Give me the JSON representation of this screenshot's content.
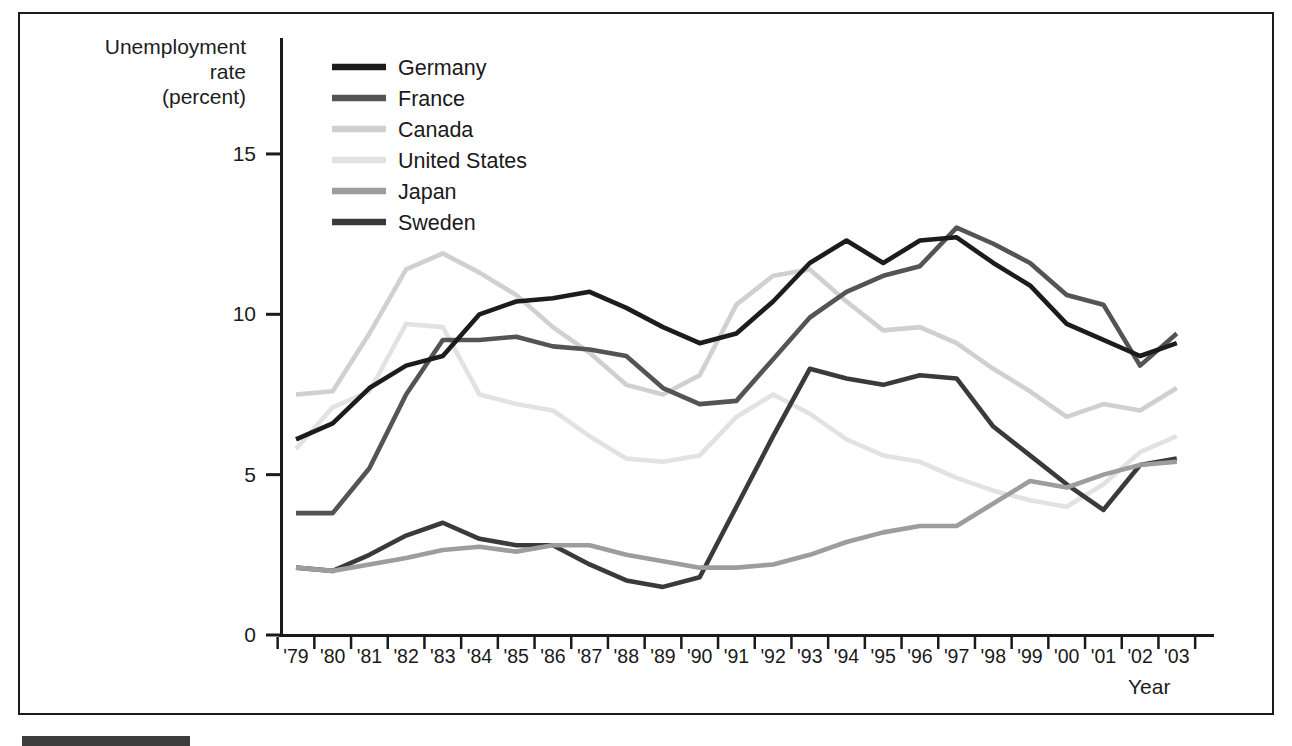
{
  "figure": {
    "y_axis_title": "Unemployment\nrate\n(percent)",
    "x_axis_title": "Year",
    "y_tick_labels": [
      "0",
      "5",
      "10",
      "15"
    ],
    "frame_color": "#1b1b1b",
    "axis_color": "#1a1a1a",
    "bottom_bar_color": "#3d3d3d"
  },
  "chart_data": {
    "type": "line",
    "title": "",
    "xlabel": "Year",
    "ylabel": "Unemployment rate (percent)",
    "ylim": [
      0,
      18.6
    ],
    "y_ticks": [
      0,
      5,
      10,
      15
    ],
    "grid": false,
    "legend_position": "top-left-inside",
    "x": [
      "'79",
      "'80",
      "'81",
      "'82",
      "'83",
      "'84",
      "'85",
      "'86",
      "'87",
      "'88",
      "'89",
      "'90",
      "'91",
      "'92",
      "'93",
      "'94",
      "'95",
      "'96",
      "'97",
      "'98",
      "'99",
      "'00",
      "'01",
      "'02",
      "'03"
    ],
    "series": [
      {
        "name": "Germany",
        "color": "#1c1c1c",
        "values": [
          6.1,
          6.6,
          7.7,
          8.4,
          8.7,
          10.0,
          10.4,
          10.5,
          10.7,
          10.2,
          9.6,
          9.1,
          9.4,
          10.4,
          11.6,
          12.3,
          11.6,
          12.3,
          12.4,
          11.6,
          10.9,
          9.7,
          9.2,
          8.7,
          9.1
        ]
      },
      {
        "name": "France",
        "color": "#545454",
        "values": [
          3.8,
          3.8,
          5.2,
          7.5,
          9.2,
          9.2,
          9.3,
          9.0,
          8.9,
          8.7,
          7.7,
          7.2,
          7.3,
          8.6,
          9.9,
          10.7,
          11.2,
          11.5,
          12.7,
          12.2,
          11.6,
          10.6,
          10.3,
          8.4,
          9.4
        ]
      },
      {
        "name": "Canada",
        "color": "#d0d0d0",
        "values": [
          7.5,
          7.6,
          9.4,
          11.4,
          11.9,
          11.3,
          10.6,
          9.6,
          8.8,
          7.8,
          7.5,
          8.1,
          10.3,
          11.2,
          11.4,
          10.4,
          9.5,
          9.6,
          9.1,
          8.3,
          7.6,
          6.8,
          7.2,
          7.0,
          7.7
        ]
      },
      {
        "name": "United States",
        "color": "#e2e2e2",
        "values": [
          5.8,
          7.1,
          7.6,
          9.7,
          9.6,
          7.5,
          7.2,
          7.0,
          6.2,
          5.5,
          5.4,
          5.6,
          6.8,
          7.5,
          6.9,
          6.1,
          5.6,
          5.4,
          4.9,
          4.5,
          4.2,
          4.0,
          4.7,
          5.7,
          6.2
        ]
      },
      {
        "name": "Japan",
        "color": "#9d9d9d",
        "values": [
          2.1,
          2.0,
          2.2,
          2.4,
          2.65,
          2.75,
          2.6,
          2.8,
          2.8,
          2.5,
          2.3,
          2.1,
          2.1,
          2.2,
          2.5,
          2.9,
          3.2,
          3.4,
          3.4,
          4.1,
          4.8,
          4.6,
          5.0,
          5.3,
          5.4
        ]
      },
      {
        "name": "Sweden",
        "color": "#3a3a3a",
        "values": [
          2.1,
          2.0,
          2.5,
          3.1,
          3.5,
          3.0,
          2.8,
          2.8,
          2.2,
          1.7,
          1.5,
          1.8,
          4.0,
          6.2,
          8.3,
          8.0,
          7.8,
          8.1,
          8.0,
          6.5,
          5.6,
          4.7,
          3.9,
          5.3,
          5.5
        ]
      }
    ],
    "draw_order": [
      "Canada",
      "United States",
      "France",
      "Sweden",
      "Japan",
      "Germany"
    ]
  }
}
